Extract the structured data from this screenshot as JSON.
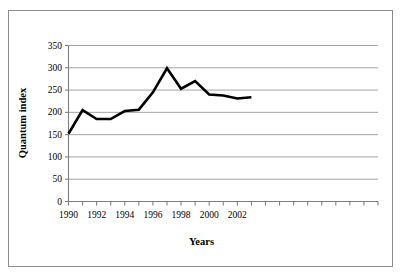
{
  "chart_data": {
    "type": "line",
    "title": "",
    "xlabel": "Years",
    "ylabel": "Quantum index",
    "x": [
      1990,
      1991,
      1992,
      1993,
      1994,
      1995,
      1996,
      1997,
      1998,
      1999,
      2000,
      2001,
      2002,
      2003
    ],
    "values": [
      152,
      205,
      185,
      185,
      203,
      206,
      245,
      299,
      253,
      270,
      240,
      238,
      231,
      234
    ],
    "series": [
      {
        "name": "Quantum index",
        "values": [
          152,
          205,
          185,
          185,
          203,
          206,
          245,
          299,
          253,
          270,
          240,
          238,
          231,
          234
        ]
      }
    ],
    "xlim": [
      1990,
      2012
    ],
    "ylim": [
      0,
      350
    ],
    "ytick_values": [
      0,
      50,
      100,
      150,
      200,
      250,
      300,
      350
    ],
    "ytick_labels": [
      "0",
      "50",
      "100",
      "150",
      "200",
      "250",
      "300",
      "350"
    ],
    "xtick_values": [
      1990,
      1991,
      1992,
      1993,
      1994,
      1995,
      1996,
      1997,
      1998,
      1999,
      2000,
      2001,
      2002,
      2003,
      2004,
      2005,
      2006,
      2007,
      2008,
      2009,
      2010,
      2011,
      2012
    ],
    "xtick_labels_shown": [
      {
        "value": 1990,
        "label": "1990"
      },
      {
        "value": 1992,
        "label": "1992"
      },
      {
        "value": 1994,
        "label": "1994"
      },
      {
        "value": 1996,
        "label": "1996"
      },
      {
        "value": 1998,
        "label": "1998"
      },
      {
        "value": 2000,
        "label": "2000"
      },
      {
        "value": 2002,
        "label": "2002"
      }
    ],
    "grid": {
      "horizontal": true,
      "vertical": false
    },
    "legend": {
      "visible": false,
      "position": "none"
    },
    "line_color": "#000000",
    "line_width": 2.6,
    "grid_color": "#9a9a9a",
    "axis_color": "#7f7f7f",
    "frame_color": "#8c8c8c",
    "background": "#ffffff"
  }
}
